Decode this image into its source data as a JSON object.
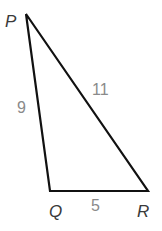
{
  "diagram": {
    "type": "triangle",
    "stroke_color": "#111111",
    "vertices": [
      {
        "name": "P",
        "label": "P",
        "x": 26,
        "y": 14
      },
      {
        "name": "Q",
        "label": "Q",
        "x": 50,
        "y": 191
      },
      {
        "name": "R",
        "label": "R",
        "x": 148,
        "y": 191
      }
    ],
    "sides": [
      {
        "name": "PQ",
        "label": "9"
      },
      {
        "name": "PR",
        "label": "11"
      },
      {
        "name": "QR",
        "label": "5"
      }
    ]
  }
}
